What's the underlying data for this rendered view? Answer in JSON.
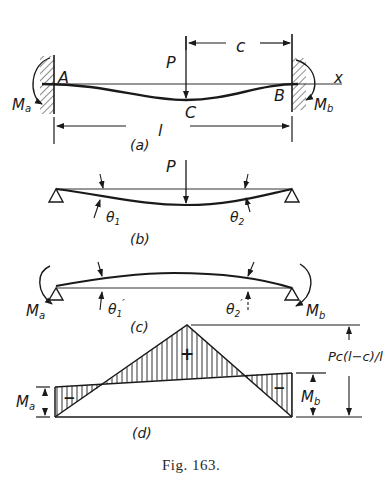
{
  "figure": {
    "caption": "Fig. 163.",
    "ink_color": "#1a1a1a",
    "background": "#ffffff"
  },
  "panel_a": {
    "label": "(a)",
    "load": "P",
    "dist_c": "c",
    "span": "l",
    "axis": "x",
    "point_a": "A",
    "point_b": "B",
    "point_c": "C",
    "moment_a": "M",
    "moment_a_sub": "a",
    "moment_b": "M",
    "moment_b_sub": "b"
  },
  "panel_b": {
    "label": "(b)",
    "load": "P",
    "theta1": "θ",
    "theta1_sub": "1",
    "theta2": "θ",
    "theta2_sub": "2"
  },
  "panel_c": {
    "label": "(c)",
    "theta1": "θ",
    "theta1_sub": "1",
    "theta1_prime": "′",
    "theta2": "θ",
    "theta2_sub": "2",
    "theta2_prime": "′",
    "moment_a": "M",
    "moment_a_sub": "a",
    "moment_b": "M",
    "moment_b_sub": "b"
  },
  "panel_d": {
    "label": "(d)",
    "positive_sign": "+",
    "negative_sign_left": "−",
    "negative_sign_right": "−",
    "peak_label": "Pc(l−c)/l",
    "moment_a": "M",
    "moment_a_sub": "a",
    "moment_b": "M",
    "moment_b_sub": "b"
  }
}
